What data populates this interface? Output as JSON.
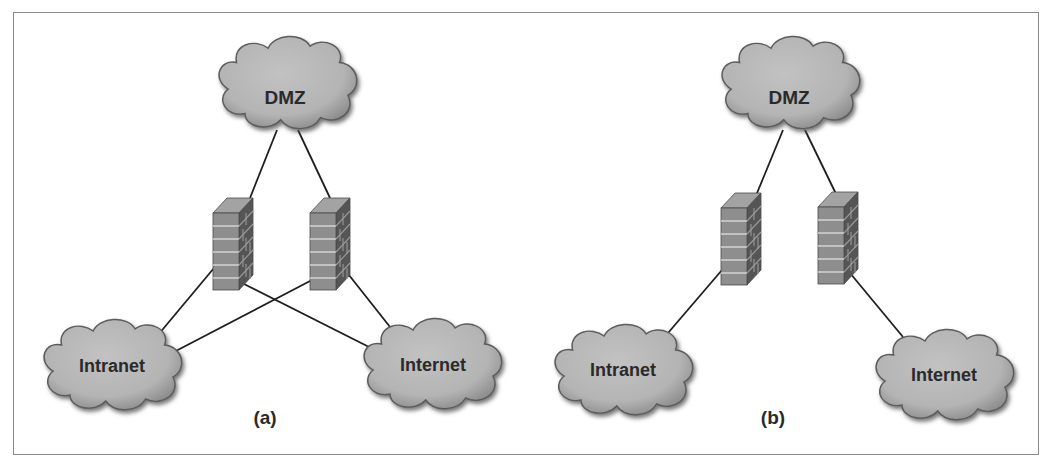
{
  "figure": {
    "panels": [
      {
        "caption": "(a)",
        "nodes": {
          "dmz": "DMZ",
          "intranet": "Intranet",
          "internet": "Internet"
        },
        "firewalls": 2,
        "description": "Two firewalls, each connected to DMZ, Intranet and Internet"
      },
      {
        "caption": "(b)",
        "nodes": {
          "dmz": "DMZ",
          "intranet": "Intranet",
          "internet": "Internet"
        },
        "firewalls": 2,
        "description": "One firewall between DMZ and Intranet, one between DMZ and Internet"
      }
    ],
    "colors": {
      "cloud_fill": "#b8b8b8",
      "cloud_shadow": "#6e6e6e",
      "brick_front": "#8c8c8c",
      "brick_side": "#5a5a5a",
      "brick_top": "#a0a0a0",
      "mortar": "#d6d6d6",
      "line": "#1e1e1e",
      "frame": "#8a8a8a"
    }
  }
}
